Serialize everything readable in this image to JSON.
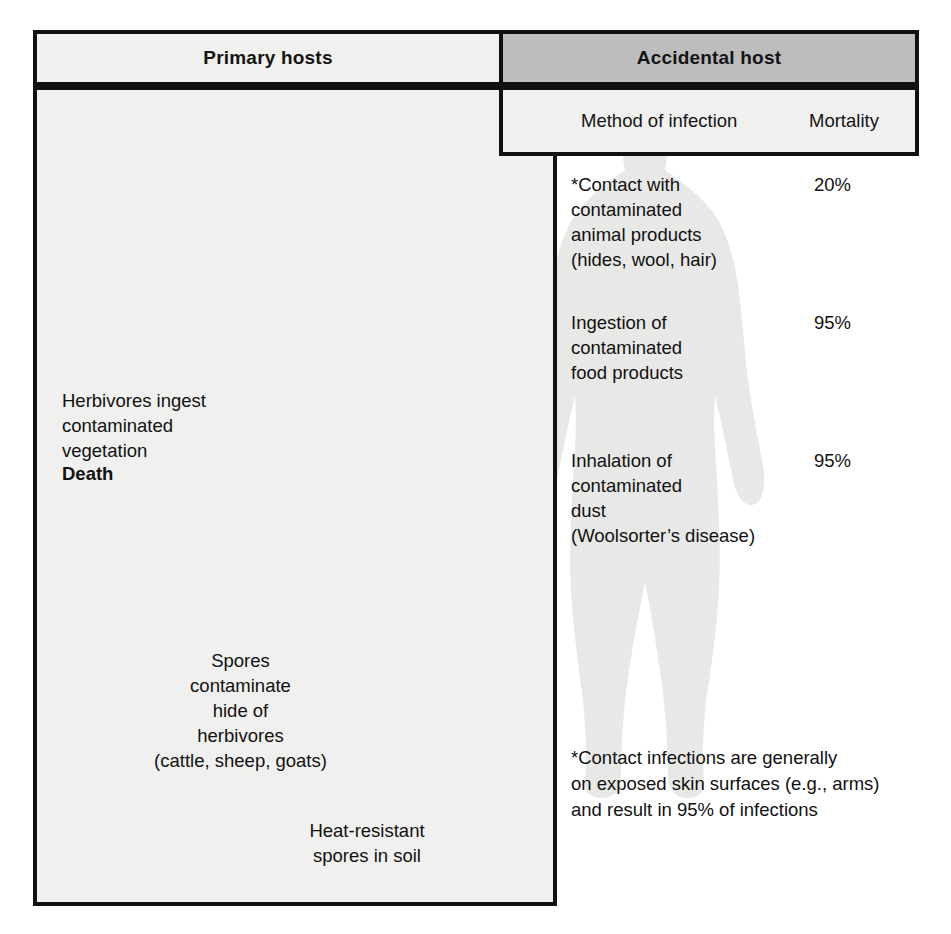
{
  "diagram": {
    "columns": {
      "primary": {
        "label": "Primary hosts"
      },
      "accidental": {
        "label": "Accidental host",
        "subheaders": {
          "method": "Method of infection",
          "mortality": "Mortality"
        }
      }
    },
    "accidental_rows": [
      {
        "method": "*Contact with\ncontaminated\nanimal products\n(hides, wool, hair)",
        "mortality": "20%"
      },
      {
        "method": "Ingestion of\ncontaminated\nfood products",
        "mortality": "95%"
      },
      {
        "method": "Inhalation of\ncontaminated\ndust\n(Woolsorter’s disease)",
        "mortality": "95%"
      }
    ],
    "footnote": "*Contact infections are generally\non exposed skin surfaces (e.g., arms)\nand result in 95% of infections",
    "primary_labels": {
      "herbivore_note": "Herbivores ingest\ncontaminated\nvegetation",
      "herbivore_outcome": "Death",
      "spores_note": "Spores\ncontaminate\nhide of\nherbivores\n(cattle, sheep, goats)",
      "soil_note": "Heat-resistant\nspores in soil"
    },
    "figures": {
      "cow": "cow-silhouette",
      "human": "human-silhouette",
      "soil_line": "soil-ground-line",
      "arrow_to_contact": "arrow-contact",
      "arrow_to_ingestion": "arrow-ingestion",
      "arrow_to_inhalation": "arrow-inhalation",
      "arrow_to_herbivore": "arrow-herbivore-death",
      "arrow_soil_to_cow": "arrow-soil-to-cow",
      "stem_left": "spore-stem-left",
      "stem_right": "spore-stem-right"
    },
    "colors": {
      "header_accent": "#bdbdbd",
      "panel": "#f0f0ee",
      "arrow_fill": "#b3b3b3",
      "arrow_stroke": "#111111",
      "text": "#111111",
      "silhouette": "#e6e6e4"
    }
  }
}
